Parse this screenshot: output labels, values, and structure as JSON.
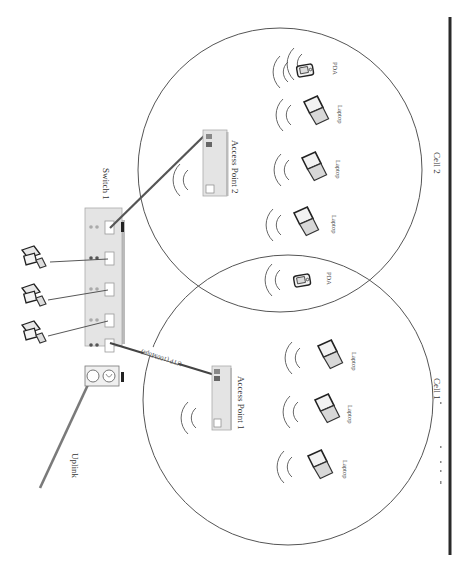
{
  "diagram": {
    "type": "network-topology",
    "orientation": "rotated-90-clockwise",
    "colors": {
      "background": "#ffffff",
      "line_dark": "#2a2a2a",
      "cable_gray": "#777777",
      "device_fill": "#e6e6e6",
      "text": "#333333"
    },
    "switch": {
      "label": "Switch 1"
    },
    "uplink": {
      "label": "Uplink"
    },
    "cable_label": "UTP (100Mbps)",
    "access_points": [
      {
        "label": "Access Point 1"
      },
      {
        "label": "Access Point 2"
      }
    ],
    "cells": [
      {
        "label": "Cell 1",
        "devices": [
          {
            "type": "laptop",
            "label": "Laptop"
          },
          {
            "type": "laptop",
            "label": "Laptop"
          },
          {
            "type": "laptop",
            "label": "Laptop"
          }
        ]
      },
      {
        "label": "Cell 2",
        "devices": [
          {
            "type": "pda",
            "label": "PDA"
          },
          {
            "type": "laptop",
            "label": "Laptop"
          },
          {
            "type": "laptop",
            "label": "Laptop"
          },
          {
            "type": "laptop",
            "label": "Laptop"
          },
          {
            "type": "pda",
            "label": "PDA"
          }
        ]
      }
    ],
    "wired_workstations": [
      {
        "type": "desktop-pc"
      },
      {
        "type": "desktop-pc"
      },
      {
        "type": "desktop-pc"
      }
    ]
  }
}
